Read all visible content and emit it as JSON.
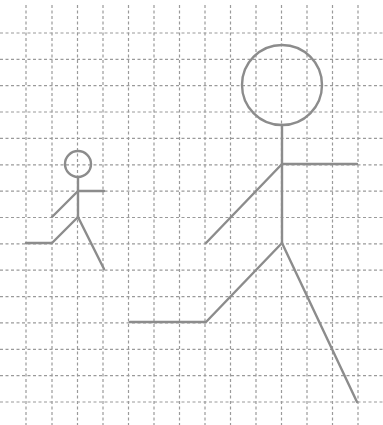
{
  "canvas": {
    "width": 383,
    "height": 425,
    "background": "#ffffff"
  },
  "grid": {
    "color": "#9a9a9a",
    "vertical_x": [
      26,
      52,
      77.5,
      103,
      128.5,
      154,
      179.5,
      205,
      230.5,
      256,
      281.5,
      307,
      332.5,
      358
    ],
    "horizontal_y": [
      33,
      59.4,
      85.7,
      112,
      138.4,
      164.8,
      191.1,
      217.5,
      243.8,
      270.2,
      296.6,
      322.9,
      349.3,
      375.6,
      402
    ],
    "x_extent": [
      0,
      383
    ],
    "y_extent": [
      5,
      425
    ]
  },
  "figures": [
    {
      "name": "small-stick-figure",
      "color": "#8c8c8c",
      "head": {
        "cx": 78,
        "cy": 164,
        "r": 13
      },
      "segments": [
        [
          [
            78,
            177
          ],
          [
            78,
            217
          ]
        ],
        [
          [
            78,
            191
          ],
          [
            104,
            191
          ]
        ],
        [
          [
            78,
            191
          ],
          [
            52,
            217
          ]
        ],
        [
          [
            78,
            217
          ],
          [
            52,
            243
          ],
          [
            26,
            243
          ]
        ],
        [
          [
            78,
            217
          ],
          [
            104,
            269
          ]
        ]
      ]
    },
    {
      "name": "large-stick-figure",
      "color": "#8c8c8c",
      "head": {
        "cx": 282,
        "cy": 85,
        "r": 40
      },
      "segments": [
        [
          [
            282,
            125
          ],
          [
            282,
            243
          ]
        ],
        [
          [
            282,
            164
          ],
          [
            357,
            164
          ]
        ],
        [
          [
            282,
            164
          ],
          [
            206,
            243
          ]
        ],
        [
          [
            282,
            243
          ],
          [
            206,
            322
          ],
          [
            130,
            322
          ]
        ],
        [
          [
            282,
            243
          ],
          [
            357,
            402
          ]
        ]
      ]
    }
  ]
}
